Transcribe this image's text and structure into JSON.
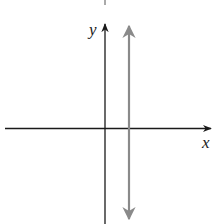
{
  "figure": {
    "x_axis_label": "x",
    "y_axis_label": "y",
    "axis_color": "#1a1a1a",
    "line_color": "#8a8a8a"
  }
}
